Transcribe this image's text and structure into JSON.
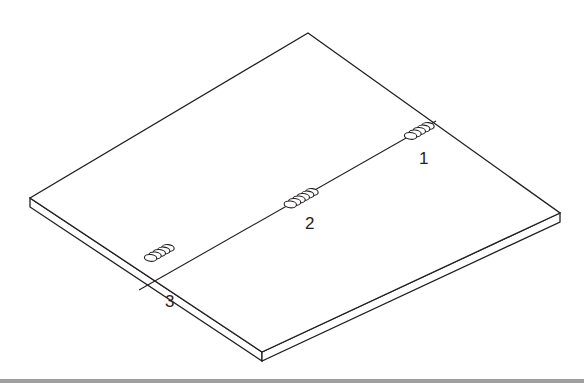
{
  "figure": {
    "colors": {
      "line": "#231f20",
      "background": "#ffffff",
      "bottom_strip": "#9e9e9e"
    }
  },
  "welds": [
    {
      "id": "weld-1",
      "label": "1"
    },
    {
      "id": "weld-2",
      "label": "2"
    },
    {
      "id": "weld-3",
      "label": "3"
    }
  ]
}
